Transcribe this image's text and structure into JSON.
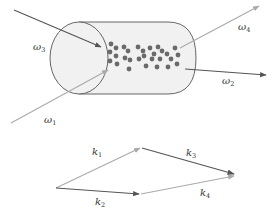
{
  "diagram": {
    "top": {
      "medium": "cylinder with atoms",
      "beams": [
        {
          "id": "omega3",
          "label": "ω",
          "sub": "3",
          "direction": "in",
          "color": "#555555"
        },
        {
          "id": "omega1",
          "label": "ω",
          "sub": "1",
          "direction": "in",
          "color": "#b0b0b0"
        },
        {
          "id": "omega4",
          "label": "ω",
          "sub": "4",
          "direction": "out",
          "color": "#b0b0b0"
        },
        {
          "id": "omega2",
          "label": "ω",
          "sub": "2",
          "direction": "out",
          "color": "#555555"
        }
      ]
    },
    "bottom": {
      "vectors": [
        {
          "id": "k1",
          "label": "k",
          "sub": "1",
          "color": "#b0b0b0"
        },
        {
          "id": "k2",
          "label": "k",
          "sub": "2",
          "color": "#555555"
        },
        {
          "id": "k3",
          "label": "k",
          "sub": "3",
          "color": "#555555"
        },
        {
          "id": "k4",
          "label": "k",
          "sub": "4",
          "color": "#b0b0b0"
        }
      ]
    },
    "colors": {
      "dark": "#555555",
      "light": "#b0b0b0",
      "dot": "#666666",
      "cylinder_fill": "#f1f1f1",
      "cylinder_stroke": "#666666"
    }
  }
}
